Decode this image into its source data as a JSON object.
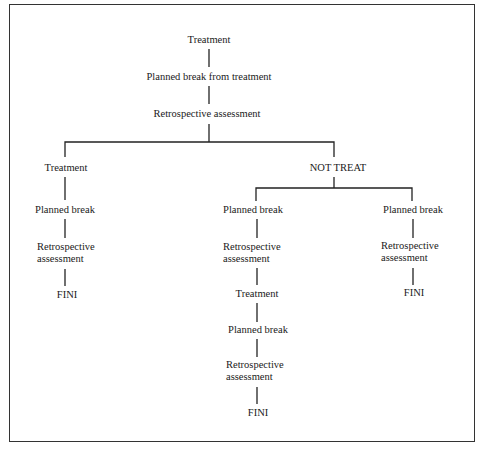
{
  "diagram": {
    "type": "flowchart-tree",
    "line_color": "#222222",
    "root": {
      "step1": "Treatment",
      "step2": "Planned break from treatment",
      "step3": "Retrospective assessment"
    },
    "left_branch": {
      "label": "Treatment",
      "step1": "Planned break",
      "step2_line1": "Retrospective",
      "step2_line2": "assessment",
      "end": "FINI"
    },
    "right_branch": {
      "label": "NOT TREAT",
      "middle": {
        "step1": "Planned break",
        "step2_line1": "Retrospective",
        "step2_line2": "assessment",
        "step3": "Treatment",
        "step4": "Planned break",
        "step5_line1": "Retrospective",
        "step5_line2": "assessment",
        "end": "FINI"
      },
      "right": {
        "step1": "Planned break",
        "step2_line1": "Retrospective",
        "step2_line2": "assessment",
        "end": "FINI"
      }
    }
  }
}
